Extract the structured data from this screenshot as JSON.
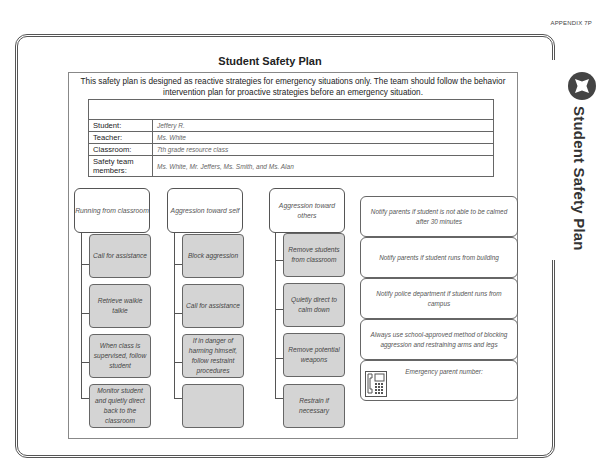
{
  "header": {
    "appendix": "APPENDIX 7P"
  },
  "side_tab": {
    "title": "Student Safety Plan",
    "icon": "star-in-circle-icon"
  },
  "document": {
    "title": "Student Safety Plan",
    "intro": "This safety plan is designed as reactive strategies for emergency situations only. The team should follow the behavior intervention plan for proactive strategies before an emergency situation."
  },
  "info": {
    "rows": [
      {
        "label": "Student:",
        "value": "Jeffery R."
      },
      {
        "label": "Teacher:",
        "value": "Ms. White"
      },
      {
        "label": "Classroom:",
        "value": "7th grade resource class"
      },
      {
        "label": "Safety team members:",
        "value": "Ms. White, Mr. Jeffers, Ms. Smith, and Ms. Alan"
      }
    ]
  },
  "columns": [
    {
      "heading": "Running from classroom",
      "steps": [
        "Call for assistance",
        "Retrieve walkie talkie",
        "When class is supervised, follow student",
        "Monitor student and quietly direct back to the classroom"
      ]
    },
    {
      "heading": "Aggression toward self",
      "steps": [
        "Block aggression",
        "Call for assistance",
        "If in danger of harming himself, follow restraint procedures",
        ""
      ]
    },
    {
      "heading": "Aggression toward others",
      "steps": [
        "Remove students from classroom",
        "Quietly direct to calm down",
        "Remove potential weapons",
        "Restrain if necessary"
      ]
    }
  ],
  "notes": [
    "Notify parents if student is not able to be calmed after 30 minutes",
    "Notify parents if student runs from building",
    "Notify police department if student runs from campus",
    "Always use school-approved method of blocking aggression and restraining arms and legs",
    "Emergency parent number:"
  ]
}
